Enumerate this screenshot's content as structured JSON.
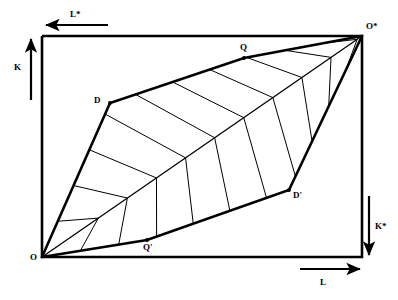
{
  "figure": {
    "type": "edgeworth-box-diagram",
    "background_color": "#ffffff",
    "stroke_color": "#000000"
  },
  "box": {
    "left": 42,
    "top": 36,
    "right": 362,
    "bottom": 257,
    "border_width": 2.6
  },
  "corners": {
    "origin_label": "O",
    "origin_star_label": "O*",
    "origin_point": [
      42,
      257
    ],
    "origin_star_point": [
      362,
      36
    ]
  },
  "vertices": [
    {
      "name": "O",
      "label": "O",
      "x": 42,
      "y": 257,
      "label_x": 30,
      "label_y": 253
    },
    {
      "name": "D",
      "label": "D",
      "x": 110,
      "y": 103,
      "label_x": 94,
      "label_y": 96
    },
    {
      "name": "Q",
      "label": "Q",
      "x": 244,
      "y": 58,
      "label_x": 240,
      "label_y": 43
    },
    {
      "name": "Ostar",
      "label": "O*",
      "x": 362,
      "y": 36,
      "label_x": 366,
      "label_y": 22
    },
    {
      "name": "Qprime",
      "label": "Q'",
      "x": 147,
      "y": 240,
      "label_x": 143,
      "label_y": 243
    },
    {
      "name": "Dprime",
      "label": "D'",
      "x": 289,
      "y": 190,
      "label_x": 293,
      "label_y": 191
    }
  ],
  "axes": [
    {
      "name": "L-star",
      "label": "L*",
      "direction": "left",
      "arrow_from": [
        108,
        25
      ],
      "arrow_to": [
        46,
        25
      ],
      "label_x": 70,
      "label_y": 10
    },
    {
      "name": "K",
      "label": "K",
      "direction": "up",
      "arrow_from": [
        31,
        100
      ],
      "arrow_to": [
        31,
        39
      ],
      "label_x": 14,
      "label_y": 63
    },
    {
      "name": "L",
      "label": "L",
      "direction": "right",
      "arrow_from": [
        300,
        269
      ],
      "arrow_to": [
        360,
        269
      ],
      "label_x": 320,
      "label_y": 278
    },
    {
      "name": "K-star",
      "label": "K*",
      "direction": "down",
      "arrow_from": [
        369,
        196
      ],
      "arrow_to": [
        369,
        255
      ],
      "label_x": 375,
      "label_y": 222
    }
  ],
  "contract_curve": {
    "name": "diagonal-O-to-Ostar",
    "points": [
      [
        42,
        257
      ],
      [
        362,
        36
      ]
    ],
    "stroke_width": 1.3
  },
  "upper_lens": {
    "name": "upper-lens-boundary",
    "boundary_points": [
      [
        42,
        257
      ],
      [
        110,
        103
      ],
      [
        244,
        58
      ],
      [
        362,
        36
      ]
    ],
    "closing_points": [
      [
        362,
        36
      ],
      [
        42,
        257
      ]
    ],
    "stroke_width": 2.6,
    "hatch_count": 10
  },
  "lower_lens": {
    "name": "lower-lens-boundary",
    "boundary_points": [
      [
        42,
        257
      ],
      [
        147,
        240
      ],
      [
        289,
        190
      ],
      [
        362,
        36
      ]
    ],
    "closing_points": [
      [
        362,
        36
      ],
      [
        42,
        257
      ]
    ],
    "stroke_width": 2.6,
    "hatch_count": 10
  },
  "hatching": {
    "stroke_width": 1.0,
    "description": "cross-hatch lines spanning from lens boundary to the O-O* diagonal"
  }
}
